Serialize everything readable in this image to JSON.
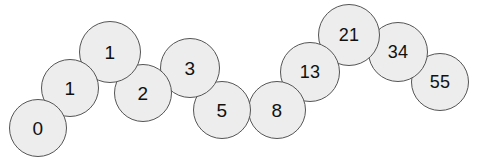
{
  "figure": {
    "name": "fibonacci-sequence-circles",
    "background_color": "#ffffff",
    "circle_fill": "#ededed",
    "circle_stroke": "#555555",
    "label_color": "#111111",
    "width": 479,
    "height": 158
  },
  "chart_data": {
    "type": "scatter",
    "title": "",
    "subtitle": "",
    "xlabel": "",
    "ylabel": "",
    "grid": false,
    "legend": null,
    "xlim": [
      0,
      479
    ],
    "ylim": [
      0,
      158
    ],
    "marker": "circle",
    "labels": [
      "0",
      "1",
      "1",
      "2",
      "3",
      "5",
      "8",
      "13",
      "21",
      "34",
      "55"
    ],
    "values": [
      0,
      1,
      1,
      2,
      3,
      5,
      8,
      13,
      21,
      34,
      55
    ],
    "x": [
      38,
      70,
      110,
      143,
      190,
      222,
      277,
      310,
      349,
      398,
      440
    ],
    "y": [
      128,
      88,
      52,
      93,
      68,
      110,
      110,
      72,
      35,
      52,
      82
    ],
    "sizes": [
      58,
      58,
      62,
      58,
      60,
      58,
      58,
      60,
      62,
      60,
      58
    ]
  },
  "nodes": [
    {
      "label": "0",
      "cx": 38,
      "cy": 128,
      "d": 58,
      "z": 20
    },
    {
      "label": "1",
      "cx": 70,
      "cy": 88,
      "d": 58,
      "z": 19
    },
    {
      "label": "1",
      "cx": 110,
      "cy": 52,
      "d": 62,
      "z": 18
    },
    {
      "label": "2",
      "cx": 143,
      "cy": 93,
      "d": 58,
      "z": 17
    },
    {
      "label": "3",
      "cx": 190,
      "cy": 68,
      "d": 60,
      "z": 16
    },
    {
      "label": "5",
      "cx": 222,
      "cy": 110,
      "d": 58,
      "z": 15
    },
    {
      "label": "8",
      "cx": 277,
      "cy": 110,
      "d": 58,
      "z": 14
    },
    {
      "label": "13",
      "cx": 310,
      "cy": 72,
      "d": 60,
      "z": 13
    },
    {
      "label": "21",
      "cx": 349,
      "cy": 35,
      "d": 62,
      "z": 12
    },
    {
      "label": "34",
      "cx": 398,
      "cy": 52,
      "d": 60,
      "z": 11
    },
    {
      "label": "55",
      "cx": 440,
      "cy": 82,
      "d": 58,
      "z": 10
    }
  ]
}
